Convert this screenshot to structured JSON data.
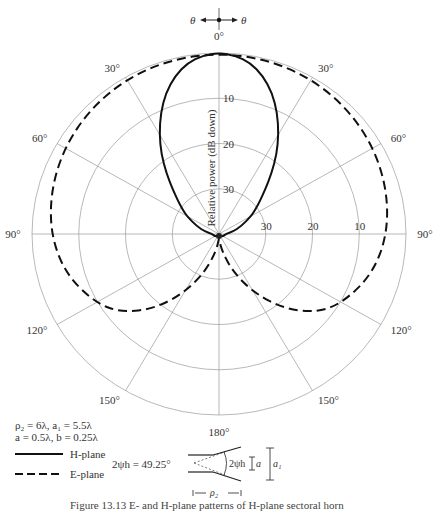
{
  "chart_data": {
    "type": "polar",
    "title": "",
    "radial_label": "Relative power (dB down)",
    "radial_ticks": [
      "10",
      "20",
      "30"
    ],
    "right_axis_ticks": [
      "30",
      "20",
      "10"
    ],
    "angle_labels": [
      "0°",
      "30°",
      "60°",
      "90°",
      "120°",
      "150°",
      "180°"
    ],
    "rlim_db": [
      0,
      40
    ],
    "grid": true,
    "theta_indicator": {
      "left": "θ",
      "right": "θ"
    },
    "legend": [
      {
        "name": "H-plane",
        "style": "solid"
      },
      {
        "name": "E-plane",
        "style": "dashed"
      }
    ],
    "series": [
      {
        "name": "H-plane",
        "style": "solid",
        "angle_deg": [
          0,
          5,
          10,
          15,
          20,
          25,
          30,
          35,
          40,
          45,
          50,
          55,
          60,
          70,
          80,
          90,
          120,
          150,
          180
        ],
        "db_down": [
          0,
          0.4,
          1.6,
          3.8,
          6.8,
          10.5,
          14.5,
          18.5,
          22.5,
          26,
          28.5,
          30.5,
          32,
          35,
          37,
          38.5,
          39,
          39.5,
          39.5
        ]
      },
      {
        "name": "E-plane",
        "style": "dashed",
        "angle_deg": [
          0,
          15,
          30,
          45,
          60,
          75,
          90,
          105,
          120,
          130,
          140,
          150,
          160,
          170,
          180
        ],
        "db_down": [
          0,
          0.1,
          0.4,
          1.0,
          1.8,
          2.8,
          4.0,
          6.0,
          9.5,
          13,
          18.5,
          25,
          31,
          36,
          39
        ]
      }
    ]
  },
  "params": {
    "line1": "ρ₂ = 6λ, a₁ = 5.5λ",
    "line2": "a = 0.5λ, b = 0.25λ",
    "half_angle": "2ψh = 49.25°"
  },
  "legend_labels": {
    "h_plane": "H-plane",
    "e_plane": "E-plane"
  },
  "diagram": {
    "angle_label": "2ψh",
    "a_label": "a",
    "a1_label": "a₁",
    "rho2_label": "ρ₂"
  },
  "caption": "Figure 13.13   E- and H-plane patterns of H-plane sectoral horn"
}
